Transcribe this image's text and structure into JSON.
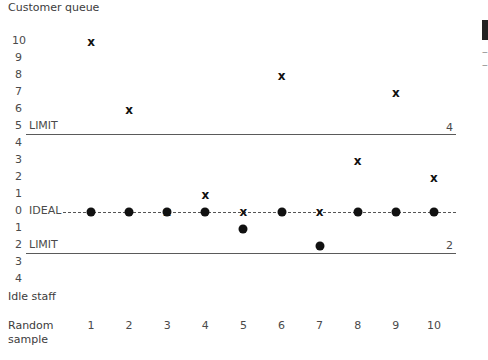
{
  "chart_data": {
    "type": "scatter",
    "title": "",
    "xlabel": "Random sample",
    "ylabel_upper": "Customer queue",
    "ylabel_lower": "Idle staff",
    "categories": [
      "1",
      "2",
      "3",
      "4",
      "5",
      "6",
      "7",
      "8",
      "9",
      "10"
    ],
    "upper_axis_ticks": [
      "10",
      "9",
      "8",
      "7",
      "6",
      "5",
      "4",
      "3",
      "2",
      "1",
      "0"
    ],
    "lower_axis_ticks": [
      "1",
      "2",
      "3",
      "4"
    ],
    "series": [
      {
        "name": "Customer queue",
        "marker": "x",
        "values": [
          10,
          6,
          0,
          1,
          0,
          8,
          0,
          3,
          7,
          2
        ]
      },
      {
        "name": "Idle staff",
        "marker": "dot",
        "values": [
          0,
          0,
          0,
          0,
          1,
          0,
          2,
          0,
          0,
          0
        ]
      }
    ],
    "reference_lines": [
      {
        "label": "LIMIT",
        "axis": "upper",
        "value": 5,
        "style": "solid",
        "end_label": "4"
      },
      {
        "label": "IDEAL",
        "axis": "center",
        "value": 0,
        "style": "dashed"
      },
      {
        "label": "LIMIT",
        "axis": "lower",
        "value": 2,
        "style": "solid",
        "end_label": "2"
      }
    ],
    "grid": false,
    "legend": "none"
  },
  "labels": {
    "upper_title": "Customer queue",
    "lower_title": "Idle staff",
    "x_title_1": "Random",
    "x_title_2": "sample",
    "limit": "LIMIT",
    "ideal": "IDEAL",
    "upper_limit_count": "4",
    "lower_limit_count": "2"
  }
}
